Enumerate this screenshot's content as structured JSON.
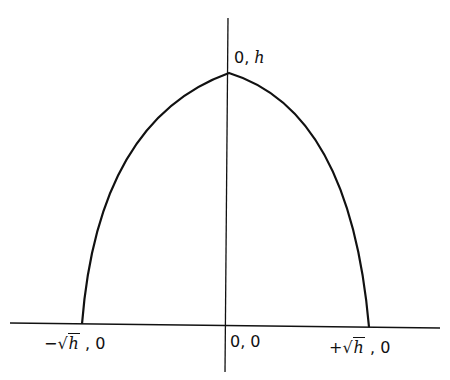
{
  "diagram": {
    "type": "parabola",
    "equation": "y = h - x^2",
    "labels": {
      "vertex": {
        "pre": "0, ",
        "var": "h"
      },
      "origin": "0, 0",
      "left_root": {
        "sign": "−",
        "root_sym": "√",
        "var": "h",
        "post": " , 0"
      },
      "right_root": {
        "sign": "+",
        "root_sym": "√",
        "var": "h",
        "post": " , 0"
      }
    },
    "colors": {
      "stroke": "#111111",
      "background": "#ffffff"
    }
  }
}
